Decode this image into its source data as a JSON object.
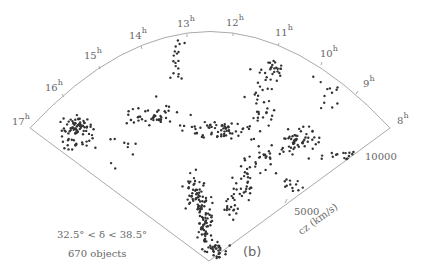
{
  "chart_data": {
    "type": "scatter",
    "subtype": "redshift-survey wedge (cone) diagram",
    "panel_label": "(b)",
    "angular_axis": {
      "quantity": "right ascension",
      "tick_labels": [
        "8h",
        "9h",
        "10h",
        "11h",
        "12h",
        "13h",
        "14h",
        "15h",
        "16h",
        "17h"
      ],
      "range_hours": [
        8,
        17
      ]
    },
    "radial_axis": {
      "label": "cz (km/s)",
      "tick_labels": [
        "5000",
        "10000"
      ],
      "ticks": [
        5000,
        10000
      ],
      "range": [
        0,
        12000
      ]
    },
    "annotation_declination": "32.5° < δ < 38.5°",
    "annotation_count": "670 objects",
    "n_objects": 670
  },
  "labels": {
    "h17": "17",
    "h16": "16",
    "h15": "15",
    "h14": "14",
    "h13": "13",
    "h12": "12",
    "h11": "11",
    "h10": "10",
    "h9": "9",
    "h8": "8",
    "hour_sup": "h",
    "r5000": "5000",
    "r10000": "10000",
    "axis": "cz (km/s)",
    "panel": "(b)",
    "dec_range": "32.5° < δ < 38.5°",
    "count": "670 objects"
  },
  "colors": {
    "axis_line": "#aaaaaa",
    "dots": "#333333",
    "text": "#666666"
  }
}
